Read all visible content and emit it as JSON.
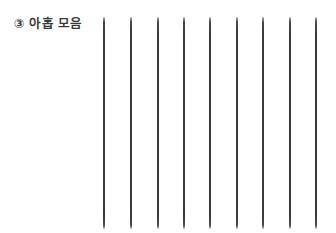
{
  "page": {
    "background_color": "#ffffff",
    "width": 336,
    "height": 233
  },
  "prompt": {
    "marker": "③",
    "text": "아홉 모음",
    "full_label": "③ 아홉 모음",
    "color": "#3b3b3b"
  },
  "stroke_field": {
    "description": "vertical practice strokes",
    "count": 9,
    "line_color": "#3a3a3a",
    "line_thickness_px": 2,
    "top_px": 17,
    "bottom_px": 229,
    "length_px": 212,
    "x_positions_px": [
      103,
      130,
      157,
      183,
      209,
      236,
      262,
      289,
      315
    ],
    "spacing_px": 26.5
  }
}
